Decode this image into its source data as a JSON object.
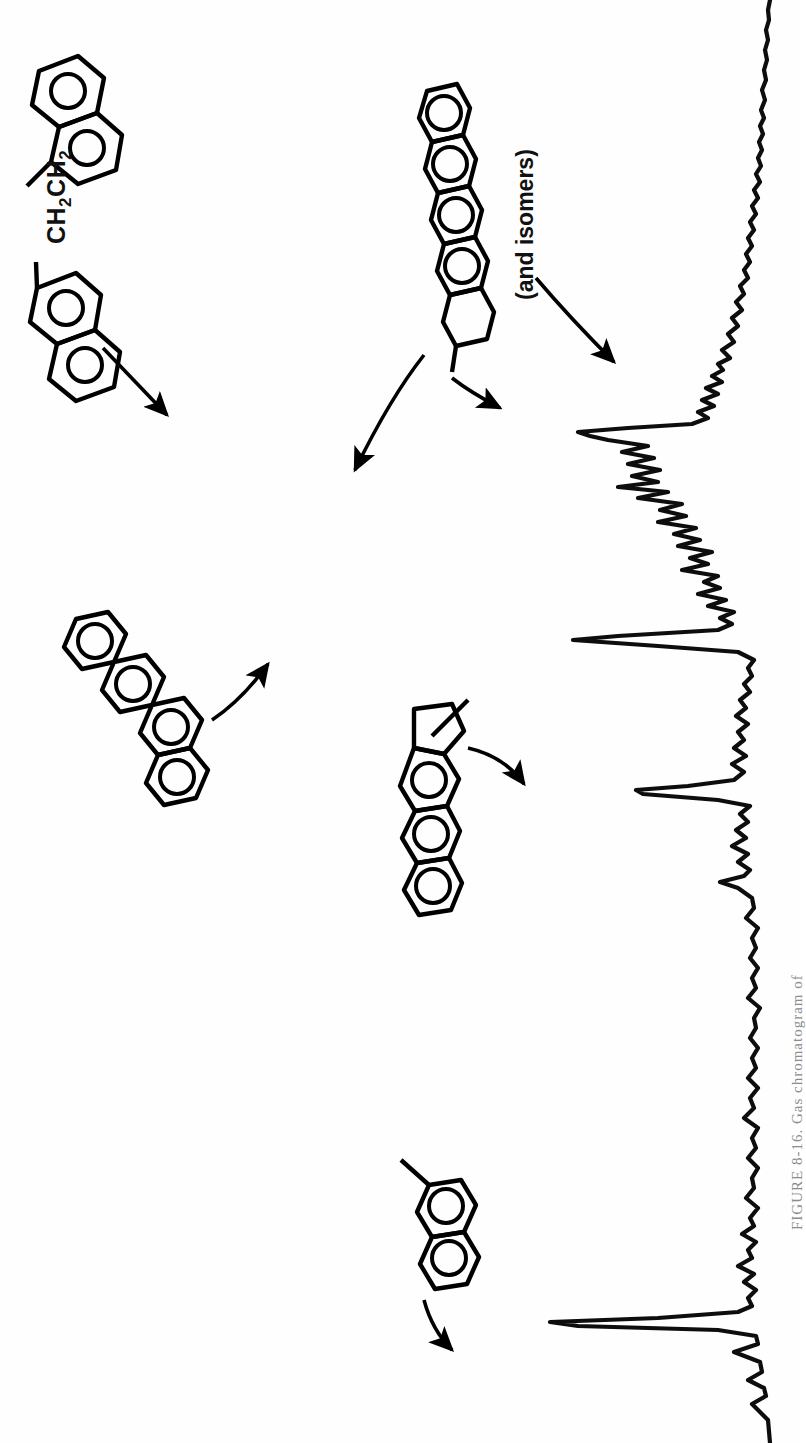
{
  "figure": {
    "caption": "FIGURE 8-16.  Gas chromatogram of",
    "caption_number": "8-16",
    "orientation_degrees": 90,
    "background_color": "#ffffff",
    "ink_color": "#000000"
  },
  "annotations": {
    "side_chain_label": "CH2CH2",
    "side_chain_label_parts": {
      "pre": "CH",
      "sub1": "2",
      "mid": "CH",
      "sub2": "2"
    },
    "isomers_note": "(and isomers)"
  },
  "structures": [
    {
      "id": "dinaphthylethane",
      "name": "1,2-di(2-naphthyl)ethane",
      "rings": 4,
      "label": "CH2CH2",
      "position": {
        "x": 30,
        "y": 50
      },
      "points_to_peak": "peak-dinaphthylethane"
    },
    {
      "id": "pentacyclic-pah",
      "name": "five-ring linear polycyclic aromatic hydrocarbon",
      "rings": 5,
      "aromatic_rings": 4,
      "label": "(and isomers)",
      "position": {
        "x": 405,
        "y": 85
      },
      "points_to_peak": "peak-pentacyclic"
    },
    {
      "id": "chrysene",
      "name": "four-ring angular polycyclic aromatic hydrocarbon",
      "rings": 4,
      "position": {
        "x": 60,
        "y": 610
      },
      "points_to_peak": "peak-chrysene"
    },
    {
      "id": "methyl-cyclopenta-anthracene",
      "name": "methyl cyclopenta-fused anthracene",
      "rings": 4,
      "position": {
        "x": 395,
        "y": 695
      },
      "points_to_peak": "peak-methylanthracene"
    },
    {
      "id": "methylnaphthalene",
      "name": "methylnaphthalene",
      "rings": 2,
      "position": {
        "x": 345,
        "y": 1155
      },
      "points_to_peak": "peak-methylnaphthalene"
    }
  ],
  "chart_data": {
    "type": "line",
    "subtitle": "",
    "orientation": "rotated-90-clockwise",
    "xlabel": "Retention time (increasing downward)",
    "ylabel": "Detector response",
    "grid": false,
    "legend": null,
    "xlim": [
      0,
      1443
    ],
    "ylim": [
      0,
      240
    ],
    "baseline_value": 0,
    "annotated_peaks": [
      {
        "id": "peak-methylnaphthalene",
        "label": "methylnaphthalene",
        "retention": 1322,
        "height": 225
      },
      {
        "id": "peak-methylanthracene",
        "label": "methyl cyclopenta-anthracene",
        "retention": 790,
        "height": 140
      },
      {
        "id": "peak-chrysene",
        "label": "chrysene",
        "retention": 640,
        "height": 205
      },
      {
        "id": "peak-dinaphthylethane",
        "label": "1,2-di(2-naphthyl)ethane",
        "retention": 432,
        "height": 200
      },
      {
        "id": "peak-pentacyclic-b",
        "label": "pentacyclic isomer",
        "retention": 487,
        "height": 160
      },
      {
        "id": "peak-pentacyclic",
        "label": "pentacyclic PAH",
        "retention": 425,
        "height": 80
      },
      {
        "id": "peak-isomers",
        "label": "isomers cluster",
        "retention": 370,
        "height": 55
      }
    ],
    "series": [
      {
        "name": "detector-signal",
        "note": "Signal trace; retention time runs down the page, response extends to the left.",
        "points": [
          [
            1443,
            8
          ],
          [
            1420,
            10
          ],
          [
            1404,
            26
          ],
          [
            1396,
            12
          ],
          [
            1388,
            14
          ],
          [
            1380,
            30
          ],
          [
            1372,
            16
          ],
          [
            1362,
            18
          ],
          [
            1352,
            44
          ],
          [
            1344,
            20
          ],
          [
            1336,
            22
          ],
          [
            1330,
            60
          ],
          [
            1326,
            200
          ],
          [
            1322,
            228
          ],
          [
            1318,
            120
          ],
          [
            1312,
            40
          ],
          [
            1306,
            26
          ],
          [
            1298,
            30
          ],
          [
            1290,
            22
          ],
          [
            1282,
            34
          ],
          [
            1274,
            24
          ],
          [
            1266,
            40
          ],
          [
            1258,
            26
          ],
          [
            1250,
            30
          ],
          [
            1242,
            22
          ],
          [
            1234,
            36
          ],
          [
            1226,
            24
          ],
          [
            1218,
            28
          ],
          [
            1208,
            20
          ],
          [
            1198,
            32
          ],
          [
            1188,
            24
          ],
          [
            1178,
            26
          ],
          [
            1168,
            20
          ],
          [
            1158,
            30
          ],
          [
            1148,
            22
          ],
          [
            1138,
            26
          ],
          [
            1128,
            20
          ],
          [
            1118,
            34
          ],
          [
            1108,
            24
          ],
          [
            1098,
            28
          ],
          [
            1088,
            20
          ],
          [
            1078,
            30
          ],
          [
            1068,
            22
          ],
          [
            1058,
            26
          ],
          [
            1048,
            20
          ],
          [
            1038,
            28
          ],
          [
            1028,
            22
          ],
          [
            1018,
            24
          ],
          [
            1008,
            18
          ],
          [
            998,
            30
          ],
          [
            988,
            22
          ],
          [
            978,
            26
          ],
          [
            968,
            20
          ],
          [
            958,
            28
          ],
          [
            948,
            22
          ],
          [
            938,
            26
          ],
          [
            928,
            20
          ],
          [
            918,
            32
          ],
          [
            908,
            24
          ],
          [
            898,
            26
          ],
          [
            888,
            40
          ],
          [
            882,
            58
          ],
          [
            876,
            34
          ],
          [
            870,
            28
          ],
          [
            862,
            40
          ],
          [
            854,
            30
          ],
          [
            846,
            46
          ],
          [
            838,
            32
          ],
          [
            830,
            42
          ],
          [
            822,
            30
          ],
          [
            814,
            38
          ],
          [
            806,
            28
          ],
          [
            800,
            60
          ],
          [
            794,
            135
          ],
          [
            790,
            142
          ],
          [
            786,
            90
          ],
          [
            780,
            44
          ],
          [
            772,
            34
          ],
          [
            764,
            46
          ],
          [
            756,
            32
          ],
          [
            748,
            44
          ],
          [
            740,
            34
          ],
          [
            732,
            40
          ],
          [
            724,
            30
          ],
          [
            716,
            42
          ],
          [
            708,
            32
          ],
          [
            700,
            38
          ],
          [
            692,
            28
          ],
          [
            684,
            34
          ],
          [
            676,
            26
          ],
          [
            668,
            30
          ],
          [
            660,
            24
          ],
          [
            652,
            40
          ],
          [
            646,
            120
          ],
          [
            640,
            205
          ],
          [
            636,
            160
          ],
          [
            630,
            60
          ],
          [
            624,
            46
          ],
          [
            618,
            58
          ],
          [
            612,
            44
          ],
          [
            606,
            70
          ],
          [
            600,
            52
          ],
          [
            594,
            80
          ],
          [
            588,
            58
          ],
          [
            582,
            74
          ],
          [
            576,
            60
          ],
          [
            570,
            96
          ],
          [
            564,
            70
          ],
          [
            558,
            88
          ],
          [
            552,
            66
          ],
          [
            546,
            100
          ],
          [
            540,
            78
          ],
          [
            534,
            104
          ],
          [
            528,
            82
          ],
          [
            522,
            120
          ],
          [
            516,
            92
          ],
          [
            510,
            118
          ],
          [
            504,
            96
          ],
          [
            498,
            140
          ],
          [
            492,
            110
          ],
          [
            487,
            160
          ],
          [
            482,
            120
          ],
          [
            476,
            146
          ],
          [
            470,
            118
          ],
          [
            464,
            150
          ],
          [
            458,
            124
          ],
          [
            452,
            156
          ],
          [
            446,
            130
          ],
          [
            440,
            170
          ],
          [
            436,
            188
          ],
          [
            432,
            200
          ],
          [
            428,
            150
          ],
          [
            424,
            86
          ],
          [
            418,
            70
          ],
          [
            412,
            80
          ],
          [
            406,
            64
          ],
          [
            400,
            76
          ],
          [
            394,
            60
          ],
          [
            388,
            72
          ],
          [
            382,
            56
          ],
          [
            376,
            66
          ],
          [
            370,
            55
          ],
          [
            364,
            60
          ],
          [
            358,
            48
          ],
          [
            350,
            56
          ],
          [
            342,
            44
          ],
          [
            334,
            50
          ],
          [
            326,
            40
          ],
          [
            318,
            46
          ],
          [
            310,
            36
          ],
          [
            302,
            42
          ],
          [
            294,
            34
          ],
          [
            286,
            38
          ],
          [
            278,
            30
          ],
          [
            270,
            34
          ],
          [
            262,
            28
          ],
          [
            254,
            32
          ],
          [
            246,
            26
          ],
          [
            238,
            30
          ],
          [
            230,
            24
          ],
          [
            222,
            28
          ],
          [
            214,
            22
          ],
          [
            206,
            26
          ],
          [
            198,
            20
          ],
          [
            190,
            24
          ],
          [
            182,
            18
          ],
          [
            174,
            22
          ],
          [
            166,
            17
          ],
          [
            158,
            20
          ],
          [
            150,
            16
          ],
          [
            142,
            19
          ],
          [
            134,
            15
          ],
          [
            126,
            18
          ],
          [
            118,
            14
          ],
          [
            110,
            17
          ],
          [
            100,
            13
          ],
          [
            90,
            16
          ],
          [
            80,
            12
          ],
          [
            70,
            14
          ],
          [
            60,
            11
          ],
          [
            50,
            13
          ],
          [
            40,
            10
          ],
          [
            30,
            12
          ],
          [
            20,
            9
          ],
          [
            10,
            10
          ],
          [
            0,
            8
          ]
        ]
      }
    ]
  }
}
